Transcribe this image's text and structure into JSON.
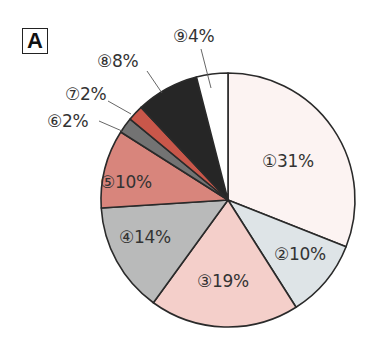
{
  "panel_label": "A",
  "chart_data": {
    "type": "pie",
    "title": "",
    "start_angle_deg": 0,
    "direction": "clockwise",
    "center": [
      228,
      200
    ],
    "radius": 127,
    "slices": [
      {
        "id": 1,
        "marker": "①",
        "label": "①31%",
        "value": 31,
        "color": "#fcf3f2",
        "label_pos": [
          262,
          153
        ],
        "leader": null
      },
      {
        "id": 2,
        "marker": "②",
        "label": "②10%",
        "value": 10,
        "color": "#dee4e7",
        "label_pos": [
          274,
          246
        ],
        "leader": null
      },
      {
        "id": 3,
        "marker": "③",
        "label": "③19%",
        "value": 19,
        "color": "#f4cfca",
        "label_pos": [
          197,
          273
        ],
        "leader": null
      },
      {
        "id": 4,
        "marker": "④",
        "label": "④14%",
        "value": 14,
        "color": "#b9baba",
        "label_pos": [
          119,
          229
        ],
        "leader": null
      },
      {
        "id": 5,
        "marker": "⑤",
        "label": "⑤10%",
        "value": 10,
        "color": "#d8857c",
        "label_pos": [
          100,
          174
        ],
        "leader": null
      },
      {
        "id": 6,
        "marker": "⑥",
        "label": "⑥2%",
        "value": 2,
        "color": "#737373",
        "label_pos": [
          47,
          113
        ],
        "leader": [
          [
            99,
            121
          ],
          [
            122,
            131
          ]
        ]
      },
      {
        "id": 7,
        "marker": "⑦",
        "label": "⑦2%",
        "value": 2,
        "color": "#c9574a",
        "label_pos": [
          65,
          86
        ],
        "leader": [
          [
            108,
            101
          ],
          [
            131,
            114
          ]
        ]
      },
      {
        "id": 8,
        "marker": "⑧",
        "label": "⑧8%",
        "value": 8,
        "color": "#262626",
        "label_pos": [
          97,
          53
        ],
        "leader": [
          [
            147,
            71
          ],
          [
            162,
            93
          ]
        ]
      },
      {
        "id": 9,
        "marker": "⑨",
        "label": "⑨4%",
        "value": 4,
        "color": "#ffffff",
        "label_pos": [
          173,
          28
        ],
        "leader": [
          [
            201,
            49
          ],
          [
            211,
            88
          ]
        ]
      }
    ],
    "stroke_color": "#2a2a2a",
    "legend": "none"
  }
}
